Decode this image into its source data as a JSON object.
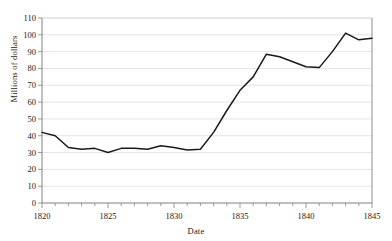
{
  "chart_data": {
    "type": "line",
    "title": "",
    "xlabel": "Date",
    "ylabel": "Millions of dollars",
    "xlim": [
      1820,
      1845
    ],
    "ylim": [
      0,
      110
    ],
    "ytick_step": 10,
    "xtick_step": 5,
    "x_minor_tick_step": 1,
    "grid": true,
    "grid_axis": "y",
    "legend": false,
    "legend_position": "none",
    "line_color": "#1a1a1a",
    "grid_color": "#d9d9d9",
    "axis_color": "#808080",
    "background_color": "#ffffff",
    "x": [
      1820,
      1821,
      1822,
      1823,
      1824,
      1825,
      1826,
      1827,
      1828,
      1829,
      1830,
      1831,
      1832,
      1833,
      1834,
      1835,
      1836,
      1837,
      1838,
      1839,
      1840,
      1841,
      1842,
      1843,
      1844,
      1845
    ],
    "series": [
      {
        "name": "Millions of dollars",
        "values": [
          42,
          40,
          33,
          32,
          32.5,
          30,
          32.5,
          32.5,
          32,
          34,
          33,
          31.5,
          32,
          42,
          55,
          67,
          75,
          88.5,
          87,
          84,
          81,
          80.5,
          90,
          101,
          97,
          98
        ]
      }
    ],
    "ytick_labels": [
      "0",
      "10",
      "20",
      "30",
      "40",
      "50",
      "60",
      "70",
      "80",
      "90",
      "100",
      "110"
    ],
    "xtick_labels": [
      "1820",
      "1825",
      "1830",
      "1835",
      "1840",
      "1845"
    ]
  },
  "axes": {
    "y_title": "Millions of dollars",
    "x_title": "Date"
  },
  "title_fragment": ""
}
